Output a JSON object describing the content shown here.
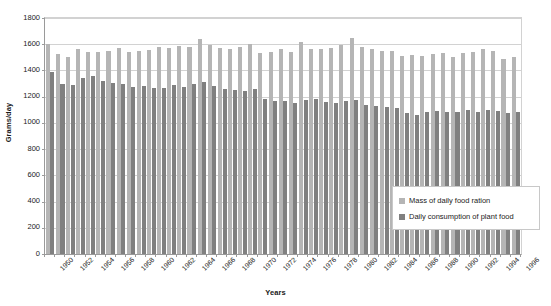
{
  "chart_data": {
    "type": "bar",
    "title": "",
    "xlabel": "Years",
    "ylabel": "Grams/day",
    "ylim": [
      0,
      1800
    ],
    "ytick_step": 200,
    "yticks": [
      0,
      200,
      400,
      600,
      800,
      1000,
      1200,
      1400,
      1600,
      1800
    ],
    "ytick_labels": [
      "0",
      "200",
      "400",
      "600",
      "800",
      "1000",
      "1200",
      "1400",
      "1600",
      "1800"
    ],
    "grid": true,
    "legend_position": "inside-bottom-right",
    "xtick_label_interval": 2,
    "categories": [
      "1950",
      "1951",
      "1952",
      "1953",
      "1954",
      "1955",
      "1956",
      "1957",
      "1958",
      "1959",
      "1960",
      "1961",
      "1962",
      "1963",
      "1964",
      "1965",
      "1966",
      "1967",
      "1968",
      "1969",
      "1970",
      "1971",
      "1972",
      "1973",
      "1974",
      "1975",
      "1976",
      "1977",
      "1978",
      "1979",
      "1980",
      "1981",
      "1982",
      "1983",
      "1984",
      "1985",
      "1986",
      "1987",
      "1988",
      "1989",
      "1990",
      "1991",
      "1992",
      "1993",
      "1994",
      "1995",
      "1996"
    ],
    "xtick_labels_shown": [
      "1950",
      "1952",
      "1954",
      "1956",
      "1958",
      "1960",
      "1962",
      "1964",
      "1966",
      "1968",
      "1970",
      "1972",
      "1974",
      "1976",
      "1978",
      "1980",
      "1982",
      "1984",
      "1986",
      "1988",
      "1990",
      "1992",
      "1994",
      "1996"
    ],
    "series": [
      {
        "name": "Mass of daily food ration",
        "color": "#b5b5b5",
        "values": [
          1600,
          1525,
          1500,
          1560,
          1540,
          1540,
          1545,
          1570,
          1540,
          1550,
          1555,
          1580,
          1570,
          1585,
          1580,
          1640,
          1595,
          1570,
          1560,
          1580,
          1600,
          1530,
          1540,
          1560,
          1540,
          1620,
          1560,
          1565,
          1570,
          1595,
          1650,
          1580,
          1560,
          1545,
          1545,
          1510,
          1520,
          1510,
          1525,
          1535,
          1500,
          1535,
          1540,
          1565,
          1545,
          1485,
          1500
        ]
      },
      {
        "name": "Daily consumption of plant food",
        "color": "#808080",
        "values": [
          1385,
          1300,
          1290,
          1345,
          1355,
          1320,
          1305,
          1295,
          1275,
          1280,
          1270,
          1265,
          1290,
          1275,
          1295,
          1310,
          1280,
          1260,
          1250,
          1245,
          1260,
          1185,
          1165,
          1165,
          1150,
          1175,
          1185,
          1160,
          1155,
          1165,
          1175,
          1140,
          1130,
          1125,
          1110,
          1075,
          1060,
          1080,
          1090,
          1085,
          1080,
          1095,
          1085,
          1100,
          1090,
          1075,
          1085
        ]
      }
    ]
  },
  "legend": {
    "entries": [
      {
        "label": "Mass of daily food ration"
      },
      {
        "label": "Daily consumption of plant food"
      }
    ]
  }
}
